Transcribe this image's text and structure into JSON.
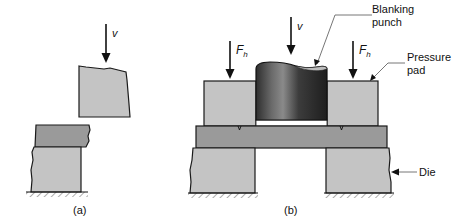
{
  "figure": {
    "panel_a": {
      "caption": "(a)",
      "velocity_label": "v"
    },
    "panel_b": {
      "caption": "(b)",
      "velocity_label": "v",
      "force_label_left": "F",
      "force_label_right": "F",
      "force_subscript": "h",
      "callouts": {
        "punch_line1": "Blanking",
        "punch_line2": "punch",
        "pad_line1": "Pressure",
        "pad_line2": "pad",
        "die": "Die"
      }
    },
    "colors": {
      "light_gray": "#c4c4c4",
      "sheet_gray": "#9a9a9a",
      "punch_dark": "#3a3a3a",
      "outline": "#1a1a1a"
    }
  }
}
